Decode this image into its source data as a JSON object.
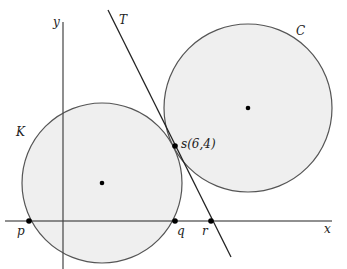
{
  "diagram": {
    "colors": {
      "circle_fill": "#efefef",
      "circle_stroke": "#555555",
      "line": "#222222",
      "point": "#000000"
    },
    "axes": {
      "x_label": "x",
      "y_label": "y"
    },
    "circles": [
      {
        "id": "K",
        "label": "K"
      },
      {
        "id": "C",
        "label": "C"
      }
    ],
    "tangent_line": {
      "label": "T"
    },
    "points": [
      {
        "id": "p",
        "label": "p"
      },
      {
        "id": "q",
        "label": "q"
      },
      {
        "id": "r",
        "label": "r"
      },
      {
        "id": "s",
        "label": "s(6,4)",
        "x": 6,
        "y": 4
      }
    ]
  }
}
